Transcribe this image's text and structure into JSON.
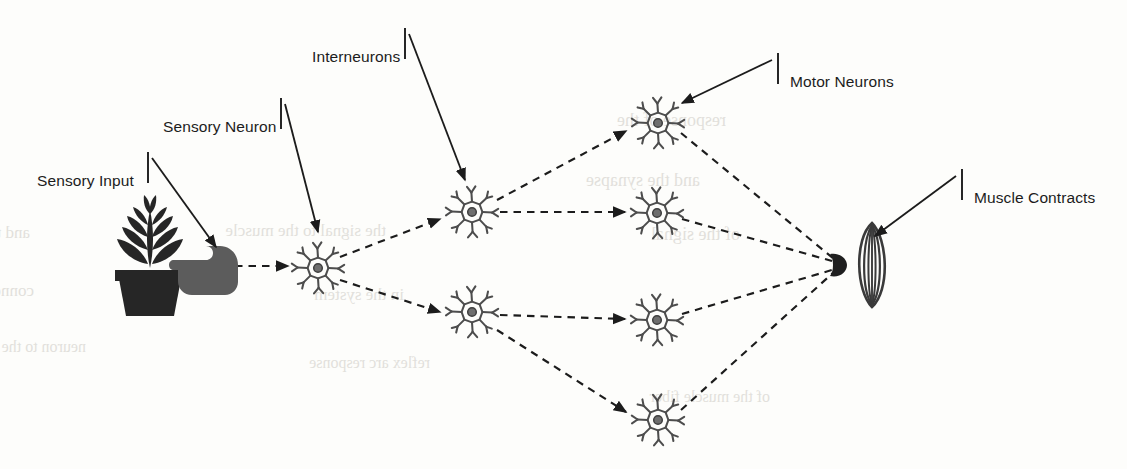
{
  "figure": {
    "type": "diagram",
    "background_color": "#fdfdfb",
    "ink_color": "#1c1c1c",
    "neuron_color": "#4a4a4a"
  },
  "labels": [
    {
      "id": "sensory-input",
      "text": "Sensory Input",
      "text_x": 37,
      "text_y": 173,
      "tick_x": 148,
      "tick_y1": 152,
      "tick_y2": 183,
      "arrow_x1": 152,
      "arrow_y1": 158,
      "arrow_x2": 216,
      "arrow_y2": 247
    },
    {
      "id": "sensory-neuron",
      "text": "Sensory Neuron",
      "text_x": 163,
      "text_y": 119,
      "tick_x": 281,
      "tick_y1": 98,
      "tick_y2": 129,
      "arrow_x1": 285,
      "arrow_y1": 104,
      "arrow_x2": 318,
      "arrow_y2": 232
    },
    {
      "id": "interneurons",
      "text": "Interneurons",
      "text_x": 312,
      "text_y": 49,
      "tick_x": 405,
      "tick_y1": 28,
      "tick_y2": 59,
      "arrow_x1": 409,
      "arrow_y1": 34,
      "arrow_x2": 465,
      "arrow_y2": 180
    },
    {
      "id": "motor-neurons",
      "text": "Motor Neurons",
      "text_x": 790,
      "text_y": 74,
      "tick_x": 778,
      "tick_y1": 53,
      "tick_y2": 84,
      "arrow_x1": 772,
      "arrow_y1": 60,
      "arrow_x2": 682,
      "arrow_y2": 103
    },
    {
      "id": "muscle-contracts",
      "text": "Muscle Contracts",
      "text_x": 974,
      "text_y": 190,
      "tick_x": 962,
      "tick_y1": 169,
      "tick_y2": 200,
      "arrow_x1": 956,
      "arrow_y1": 176,
      "arrow_x2": 875,
      "arrow_y2": 236
    }
  ],
  "nodes": {
    "stimulus": {
      "name": "potted-plant-with-hand",
      "x": 150,
      "y": 272,
      "label": "Sensory Input"
    },
    "sensory_neuron": {
      "name": "sensory-neuron",
      "x": 318,
      "y": 268
    },
    "interneurons": [
      {
        "name": "interneuron-upper",
        "x": 472,
        "y": 212
      },
      {
        "name": "interneuron-lower",
        "x": 472,
        "y": 312
      }
    ],
    "motor_neurons": [
      {
        "name": "motor-neuron-1",
        "x": 658,
        "y": 123
      },
      {
        "name": "motor-neuron-2",
        "x": 657,
        "y": 213
      },
      {
        "name": "motor-neuron-3",
        "x": 657,
        "y": 320
      },
      {
        "name": "motor-neuron-4",
        "x": 658,
        "y": 420
      }
    ],
    "synapse_terminal": {
      "name": "synaptic-terminal",
      "x": 838,
      "y": 265
    },
    "muscle": {
      "name": "striated-muscle",
      "x": 872,
      "y": 265,
      "label": "Muscle Contracts"
    }
  },
  "connections": [
    {
      "from": "stimulus",
      "to": "sensory_neuron",
      "style": "dashed-arrow"
    },
    {
      "from": "sensory_neuron",
      "to": "interneuron-upper",
      "style": "dashed-arrow"
    },
    {
      "from": "sensory_neuron",
      "to": "interneuron-lower",
      "style": "dashed-arrow"
    },
    {
      "from": "interneuron-upper",
      "to": "motor-neuron-1",
      "style": "dashed-arrow"
    },
    {
      "from": "interneuron-upper",
      "to": "motor-neuron-2",
      "style": "dashed-arrow"
    },
    {
      "from": "interneuron-lower",
      "to": "motor-neuron-3",
      "style": "dashed-arrow"
    },
    {
      "from": "interneuron-lower",
      "to": "motor-neuron-4",
      "style": "dashed-arrow"
    },
    {
      "from": "motor-neuron-1",
      "to": "synapse_terminal",
      "style": "dashed-line"
    },
    {
      "from": "motor-neuron-2",
      "to": "synapse_terminal",
      "style": "dashed-line"
    },
    {
      "from": "motor-neuron-3",
      "to": "synapse_terminal",
      "style": "dashed-line"
    },
    {
      "from": "motor-neuron-4",
      "to": "synapse_terminal",
      "style": "dashed-line"
    }
  ],
  "bleed_text": [
    {
      "text": "and the pathway involves",
      "x": 30,
      "y": 238,
      "size": 17
    },
    {
      "text": "connecting later",
      "x": 34,
      "y": 296,
      "size": 17
    },
    {
      "text": "the signal to the muscle",
      "x": 386,
      "y": 236,
      "size": 17
    },
    {
      "text": "in the system",
      "x": 404,
      "y": 300,
      "size": 17
    },
    {
      "text": "response of the",
      "x": 726,
      "y": 126,
      "size": 18
    },
    {
      "text": "and the synapse",
      "x": 700,
      "y": 186,
      "size": 18
    },
    {
      "text": "of the signal",
      "x": 740,
      "y": 240,
      "size": 18
    },
    {
      "text": "neuron to the",
      "x": 86,
      "y": 352,
      "size": 16
    },
    {
      "text": "reflex arc response",
      "x": 430,
      "y": 368,
      "size": 16
    },
    {
      "text": "of the muscle fiber",
      "x": 770,
      "y": 402,
      "size": 16
    }
  ]
}
